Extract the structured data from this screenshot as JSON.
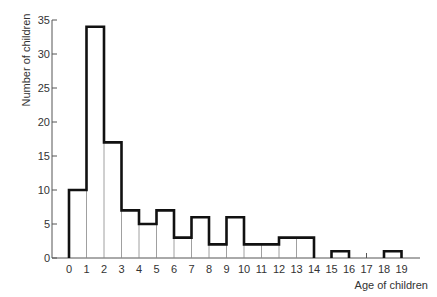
{
  "chart_data": {
    "type": "bar",
    "subtype": "histogram",
    "title": "",
    "xlabel": "Age of children",
    "ylabel": "Number of children",
    "x_ticks": [
      "0",
      "1",
      "2",
      "3",
      "4",
      "5",
      "6",
      "7",
      "8",
      "9",
      "10",
      "11",
      "12",
      "13",
      "14",
      "15",
      "16",
      "17",
      "18",
      "19"
    ],
    "y_ticks": [
      "0",
      "5",
      "10",
      "15",
      "20",
      "25",
      "30",
      "35"
    ],
    "ylim": [
      0,
      35
    ],
    "xlim": [
      0,
      19
    ],
    "grid": false,
    "legend": null,
    "bins": [
      {
        "from": 0,
        "to": 1,
        "value": 10
      },
      {
        "from": 1,
        "to": 2,
        "value": 34
      },
      {
        "from": 2,
        "to": 3,
        "value": 17
      },
      {
        "from": 3,
        "to": 4,
        "value": 7
      },
      {
        "from": 4,
        "to": 5,
        "value": 5
      },
      {
        "from": 5,
        "to": 6,
        "value": 7
      },
      {
        "from": 6,
        "to": 7,
        "value": 3
      },
      {
        "from": 7,
        "to": 8,
        "value": 6
      },
      {
        "from": 8,
        "to": 9,
        "value": 2
      },
      {
        "from": 9,
        "to": 10,
        "value": 6
      },
      {
        "from": 10,
        "to": 11,
        "value": 2
      },
      {
        "from": 11,
        "to": 12,
        "value": 2
      },
      {
        "from": 12,
        "to": 13,
        "value": 3
      },
      {
        "from": 13,
        "to": 14,
        "value": 3
      },
      {
        "from": 14,
        "to": 15,
        "value": 0
      },
      {
        "from": 15,
        "to": 16,
        "value": 1
      },
      {
        "from": 16,
        "to": 17,
        "value": 0
      },
      {
        "from": 17,
        "to": 18,
        "value": 0
      },
      {
        "from": 18,
        "to": 19,
        "value": 1
      }
    ],
    "categories": [
      "0-1",
      "1-2",
      "2-3",
      "3-4",
      "4-5",
      "5-6",
      "6-7",
      "7-8",
      "8-9",
      "9-10",
      "10-11",
      "11-12",
      "12-13",
      "13-14",
      "14-15",
      "15-16",
      "16-17",
      "17-18",
      "18-19"
    ],
    "values": [
      10,
      34,
      17,
      7,
      5,
      7,
      3,
      6,
      2,
      6,
      2,
      2,
      3,
      3,
      0,
      1,
      0,
      0,
      1
    ]
  },
  "colors": {
    "outline": "#111111",
    "divider": "#888888",
    "axis": "#555555",
    "text": "#333333"
  }
}
